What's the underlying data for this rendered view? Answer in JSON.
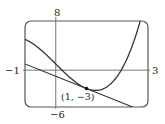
{
  "chart_data": {
    "type": "line",
    "title": "",
    "xlabel": "",
    "ylabel": "",
    "xlim": [
      -1,
      3
    ],
    "ylim": [
      -6,
      8
    ],
    "grid": false,
    "tick_labels": {
      "x_min": "−1",
      "x_max": "3",
      "y_max": "8",
      "y_min": "−6"
    },
    "series": [
      {
        "name": "curve",
        "function": "x^3 - 5x + 1",
        "x": [
          -1,
          -0.5,
          0,
          0.5,
          1,
          1.29,
          1.5,
          2,
          2.5,
          2.75
        ],
        "values": [
          5,
          3.38,
          1,
          -1.38,
          -3,
          -3.3,
          -3.13,
          -1,
          4.13,
          8.05
        ]
      },
      {
        "name": "tangent line",
        "function": "-2x - 1",
        "x": [
          -1,
          2.5
        ],
        "values": [
          1,
          -6
        ]
      }
    ],
    "annotations": [
      {
        "label": "(1, −3)",
        "x": 1,
        "y": -3,
        "marker": "dot"
      }
    ],
    "colors": {
      "stroke": "#333333",
      "frame": "#555555"
    }
  }
}
